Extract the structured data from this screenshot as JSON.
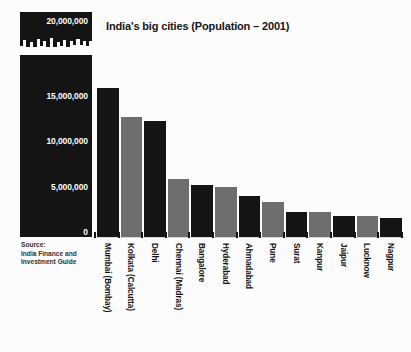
{
  "chart_data": {
    "type": "bar",
    "title": "India's big cities (Population – 2001)",
    "xlabel": "",
    "ylabel": "",
    "ylim": [
      0,
      20000000
    ],
    "grid": false,
    "legend": "none",
    "top_scale_badge": "20,000,000",
    "ytick_labels": [
      "15,000,000",
      "10,000,000",
      "5,000,000",
      "0"
    ],
    "ytick_values": [
      15000000,
      10000000,
      5000000,
      0
    ],
    "source": [
      "Source:",
      "India Finance and",
      "Investment Guide"
    ],
    "categories": [
      "Mumbai (Bombay)",
      "Kolkata (Calcutta)",
      "Delhi",
      "Chennai (Madras)",
      "Bangalore",
      "Hyderabad",
      "Ahmadabad",
      "Pune",
      "Surat",
      "Kanpur",
      "Jaipur",
      "Lucknow",
      "Nagpur"
    ],
    "values": [
      16400000,
      13200000,
      12800000,
      6400000,
      5700000,
      5500000,
      4500000,
      3800000,
      2800000,
      2700000,
      2300000,
      2300000,
      2100000
    ],
    "bar_colors": [
      "#141414",
      "#6e6e6e",
      "#141414",
      "#6e6e6e",
      "#141414",
      "#6e6e6e",
      "#141414",
      "#6e6e6e",
      "#141414",
      "#6e6e6e",
      "#141414",
      "#6e6e6e",
      "#141414"
    ]
  },
  "colors": {
    "background": "#fcfcfc",
    "dark_bar": "#141414",
    "light_bar": "#6e6e6e",
    "panel": "#141414",
    "text": "#141414",
    "panel_text": "#ffffff"
  }
}
